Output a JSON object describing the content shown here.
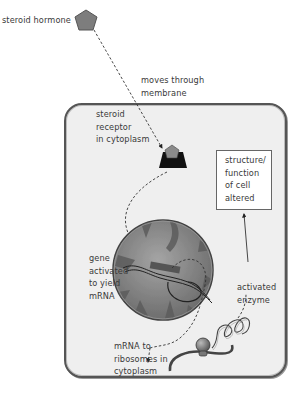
{
  "diagram": {
    "type": "steroid hormone signaling pathway",
    "labels": {
      "hormone": "steroid hormone",
      "membrane": [
        "moves through",
        "membrane"
      ],
      "receptor": [
        "steroid",
        "receptor",
        "in cytoplasm"
      ],
      "effect": [
        "structure/",
        "function",
        "of cell",
        "altered"
      ],
      "gene": [
        "gene",
        "activated",
        "to yield",
        "mRNA"
      ],
      "enzyme": [
        "activated",
        "enzyme"
      ],
      "ribosomes": [
        "mRNA to",
        "ribosomes in",
        "cytoplasm"
      ]
    },
    "elements": {
      "hormone_icon": "pentagon-icon",
      "receptor_icon": "receptor-icon",
      "nucleus": "nucleus",
      "dna": "dna-strand",
      "ribosome": "ribosome-icon",
      "protein": "protein-coil"
    },
    "colors": {
      "hormone": "#7a7a7a",
      "receptor": "#111111",
      "nucleus": "#8a8a8a",
      "cytoplasm": "#efefef",
      "arrow": "#333333"
    }
  }
}
